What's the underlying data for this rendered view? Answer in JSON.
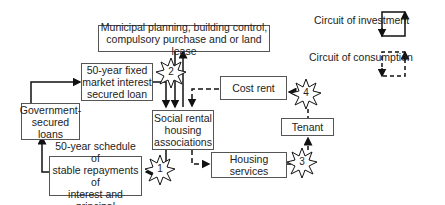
{
  "diagram": {
    "nodes": {
      "municipal": {
        "line1": "Municipal planning, building control,",
        "line2": "compulsory purchase and or land lease"
      },
      "loan": {
        "line1": "50-year fixed",
        "line2": "market interest",
        "line3": "secured loan"
      },
      "gov": {
        "line1": "Government-",
        "line2": "secured",
        "line3": "loans"
      },
      "schedule": {
        "line1": "50-year schedule of",
        "line2": "stable repayments of",
        "line3": "interest and principal"
      },
      "social": {
        "line1": "Social rental",
        "line2": "housing",
        "line3": "associations"
      },
      "cost_rent": {
        "label": "Cost rent"
      },
      "tenant": {
        "label": "Tenant"
      },
      "housing_services": {
        "label": "Housing services"
      }
    },
    "bursts": [
      "1",
      "2",
      "3",
      "4"
    ],
    "legend": {
      "investment": "Circuit of investment",
      "consumption": "Circuit of consumption"
    }
  }
}
